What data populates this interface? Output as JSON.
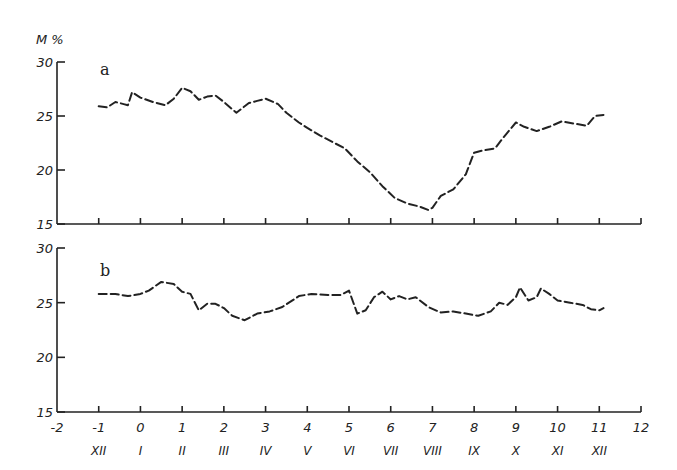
{
  "chart_data": [
    {
      "type": "line",
      "panel": "a",
      "title": "a",
      "ylabel": "M %",
      "xlabel": "",
      "ylim": [
        15,
        30
      ],
      "xlim": [
        -2,
        12
      ],
      "yticks": [
        15,
        20,
        25,
        30
      ],
      "grid": false,
      "series": [
        {
          "name": "a",
          "style": "dashed",
          "x": [
            -1.0,
            -0.8,
            -0.6,
            -0.4,
            -0.3,
            -0.2,
            0.0,
            0.3,
            0.6,
            0.8,
            1.0,
            1.2,
            1.4,
            1.6,
            1.8,
            2.0,
            2.3,
            2.6,
            2.8,
            3.0,
            3.3,
            3.5,
            3.8,
            4.0,
            4.3,
            4.6,
            4.9,
            5.2,
            5.5,
            5.8,
            6.1,
            6.4,
            6.7,
            6.9,
            7.0,
            7.2,
            7.5,
            7.8,
            8.0,
            8.2,
            8.5,
            8.7,
            9.0,
            9.2,
            9.5,
            9.8,
            10.1,
            10.4,
            10.7,
            10.9,
            11.1
          ],
          "values": [
            25.9,
            25.8,
            26.3,
            26.1,
            26.0,
            27.2,
            26.7,
            26.3,
            26.0,
            26.6,
            27.6,
            27.3,
            26.5,
            26.8,
            26.9,
            26.3,
            25.3,
            26.2,
            26.4,
            26.6,
            26.1,
            25.3,
            24.4,
            23.9,
            23.2,
            22.6,
            22.0,
            20.8,
            19.8,
            18.5,
            17.4,
            16.9,
            16.6,
            16.3,
            16.5,
            17.6,
            18.2,
            19.6,
            21.6,
            21.8,
            22.0,
            23.0,
            24.4,
            24.0,
            23.6,
            24.0,
            24.5,
            24.3,
            24.1,
            25.0,
            25.1
          ]
        }
      ]
    },
    {
      "type": "line",
      "panel": "b",
      "title": "b",
      "ylabel": "",
      "xlabel": "",
      "ylim": [
        15,
        30
      ],
      "xlim": [
        -2,
        12
      ],
      "yticks": [
        15,
        20,
        25,
        30
      ],
      "xticks": [
        -2,
        -1,
        0,
        1,
        2,
        3,
        4,
        5,
        6,
        7,
        8,
        9,
        10,
        11,
        12
      ],
      "month_labels": [
        "XII",
        "I",
        "II",
        "III",
        "IV",
        "V",
        "VI",
        "VII",
        "VIII",
        "IX",
        "X",
        "XI",
        "XII"
      ],
      "grid": false,
      "series": [
        {
          "name": "b",
          "style": "dashed",
          "x": [
            -1.0,
            -0.6,
            -0.3,
            0.0,
            0.2,
            0.5,
            0.8,
            1.0,
            1.2,
            1.4,
            1.6,
            1.8,
            2.0,
            2.2,
            2.5,
            2.8,
            3.1,
            3.4,
            3.8,
            4.1,
            4.5,
            4.8,
            5.0,
            5.2,
            5.4,
            5.6,
            5.8,
            6.0,
            6.2,
            6.4,
            6.6,
            6.9,
            7.2,
            7.5,
            7.8,
            8.1,
            8.4,
            8.6,
            8.8,
            9.0,
            9.1,
            9.3,
            9.5,
            9.6,
            9.8,
            10.0,
            10.3,
            10.6,
            10.8,
            11.0,
            11.1
          ],
          "values": [
            25.8,
            25.8,
            25.6,
            25.8,
            26.1,
            26.9,
            26.7,
            26.0,
            25.8,
            24.3,
            24.9,
            24.9,
            24.5,
            23.8,
            23.4,
            24.0,
            24.2,
            24.6,
            25.6,
            25.8,
            25.7,
            25.7,
            26.1,
            24.0,
            24.3,
            25.5,
            26.0,
            25.3,
            25.6,
            25.3,
            25.5,
            24.6,
            24.1,
            24.2,
            24.0,
            23.8,
            24.2,
            25.0,
            24.8,
            25.5,
            26.4,
            25.2,
            25.5,
            26.3,
            25.8,
            25.2,
            25.0,
            24.8,
            24.4,
            24.3,
            24.5
          ]
        }
      ]
    }
  ],
  "labels": {
    "ylabel": "M %",
    "panel_a": "a",
    "panel_b": "b",
    "yticks_a": [
      "30",
      "25",
      "20",
      "15"
    ],
    "yticks_b": [
      "30",
      "25",
      "20",
      "15"
    ],
    "xticks": [
      "-2",
      "-1",
      "0",
      "1",
      "2",
      "3",
      "4",
      "5",
      "6",
      "7",
      "8",
      "9",
      "10",
      "11",
      "12"
    ],
    "months": [
      "XII",
      "I",
      "II",
      "III",
      "IV",
      "V",
      "VI",
      "VII",
      "VIII",
      "IX",
      "X",
      "XI",
      "XII"
    ]
  }
}
